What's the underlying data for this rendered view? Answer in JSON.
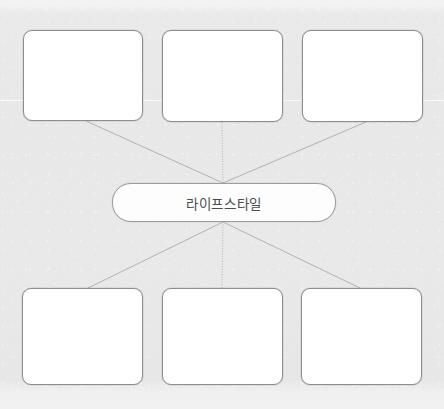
{
  "diagram": {
    "type": "mind-map",
    "title_text_visible": false,
    "background_color": "#e8e8e8",
    "node_fill_color": "#ffffff",
    "node_border_color": "#8b8d90",
    "connector_color": "#a9abaf",
    "text_color": "#4a4c50",
    "central_node": {
      "label": "라이프스타일",
      "x": 112,
      "y": 183,
      "width": 224,
      "height": 39,
      "shape": "rounded-pill"
    },
    "branch_nodes": [
      {
        "id": "top-left",
        "label": "",
        "x": 23,
        "y": 30,
        "width": 120,
        "height": 91,
        "row": "top"
      },
      {
        "id": "top-center",
        "label": "",
        "x": 162,
        "y": 30,
        "width": 121,
        "height": 92,
        "row": "top"
      },
      {
        "id": "top-right",
        "label": "",
        "x": 302,
        "y": 30,
        "width": 121,
        "height": 92,
        "row": "top"
      },
      {
        "id": "bottom-left",
        "label": "",
        "x": 22,
        "y": 288,
        "width": 121,
        "height": 97,
        "row": "bottom"
      },
      {
        "id": "bottom-center",
        "label": "",
        "x": 162,
        "y": 288,
        "width": 121,
        "height": 97,
        "row": "bottom"
      },
      {
        "id": "bottom-right",
        "label": "",
        "x": 301,
        "y": 288,
        "width": 121,
        "height": 97,
        "row": "bottom"
      }
    ],
    "connectors": [
      {
        "id": "to-top-left",
        "from": [
          223,
          183
        ],
        "to": [
          86,
          121
        ],
        "style": "solid"
      },
      {
        "id": "to-top-center",
        "from": [
          223,
          183
        ],
        "to": [
          222,
          122
        ],
        "style": "dotted"
      },
      {
        "id": "to-top-right",
        "from": [
          223,
          183
        ],
        "to": [
          366,
          122
        ],
        "style": "solid"
      },
      {
        "id": "to-bottom-left",
        "from": [
          223,
          222
        ],
        "to": [
          86,
          289
        ],
        "style": "solid"
      },
      {
        "id": "to-bottom-center",
        "from": [
          223,
          222
        ],
        "to": [
          222,
          288
        ],
        "style": "dotted"
      },
      {
        "id": "to-bottom-right",
        "from": [
          223,
          222
        ],
        "to": [
          362,
          289
        ],
        "style": "solid"
      }
    ]
  }
}
